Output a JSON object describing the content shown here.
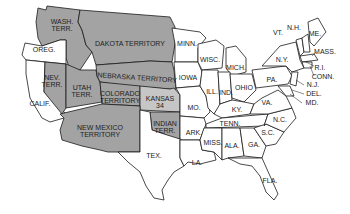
{
  "map": {
    "title": "",
    "territories": [
      {
        "name": "WASH. TERR.",
        "lines": [
          "WASH.",
          "TERR."
        ],
        "fill": "#a3a3a3"
      },
      {
        "name": "DAKOTA TERRITORY",
        "lines": [
          "DAKOTA TERRITORY"
        ],
        "fill": "#a3a3a3"
      },
      {
        "name": "NEBRASKA TERRITORY",
        "lines": [
          "NEBRASKA TERRITORY"
        ],
        "fill": "#a3a3a3"
      },
      {
        "name": "NEV. TERR.",
        "lines": [
          "NEV.",
          "TERR."
        ],
        "fill": "#a3a3a3"
      },
      {
        "name": "UTAH TERR.",
        "lines": [
          "UTAH",
          "TERR."
        ],
        "fill": "#a3a3a3"
      },
      {
        "name": "COLORADO TERRITORY",
        "lines": [
          "COLORADO",
          "TERRITORY"
        ],
        "fill": "#a3a3a3"
      },
      {
        "name": "NEW MEXICO TERRITORY",
        "lines": [
          "NEW MEXICO",
          "TERRITORY"
        ],
        "fill": "#a3a3a3"
      },
      {
        "name": "INDIAN TERR.",
        "lines": [
          "INDIAN",
          "TERR."
        ],
        "fill": "#a3a3a3"
      }
    ],
    "highlighted_state": {
      "name": "KANSAS",
      "lines": [
        "KANSAS",
        "34"
      ],
      "fill": "#c6c6c6"
    },
    "states": [
      "OREG.",
      "CALIF.",
      "TEX.",
      "MINN.",
      "IOWA",
      "MO.",
      "ARK.",
      "LA.",
      "WISC.",
      "MICH.",
      "ILL.",
      "IND.",
      "OHIO",
      "KY.",
      "TENN.",
      "MISS.",
      "ALA.",
      "GA.",
      "FLA.",
      "S.C.",
      "N.C.",
      "VA.",
      "PA.",
      "N.Y.",
      "VT.",
      "N.H.",
      "ME.",
      "MASS.",
      "R.I.",
      "CONN.",
      "N.J.",
      "DEL.",
      "MD."
    ],
    "colors": {
      "territory": "#a3a3a3",
      "kansas": "#c6c6c6",
      "state": "#ffffff",
      "border": "#1a1a1a"
    }
  }
}
